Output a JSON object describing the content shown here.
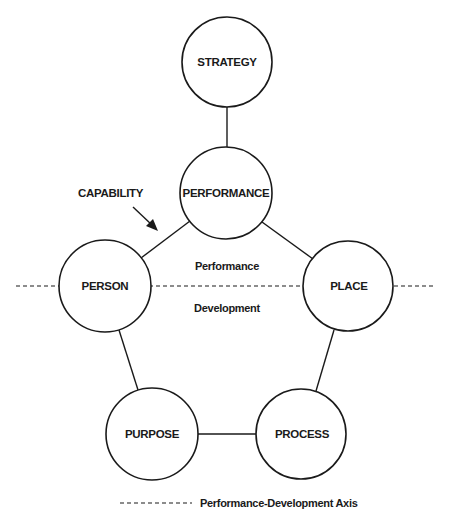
{
  "nodes": {
    "strategy": {
      "label": "STRATEGY"
    },
    "performance": {
      "label": "PERFORMANCE"
    },
    "person": {
      "label": "PERSON"
    },
    "place": {
      "label": "PLACE"
    },
    "purpose": {
      "label": "PURPOSE"
    },
    "process": {
      "label": "PROCESS"
    }
  },
  "annotations": {
    "capability": "CAPABILITY",
    "region_above": "Performance",
    "region_below": "Development"
  },
  "legend": {
    "axis_label": "Performance-Development Axis"
  },
  "edges": [
    [
      "STRATEGY",
      "PERFORMANCE"
    ],
    [
      "PERFORMANCE",
      "PERSON"
    ],
    [
      "PERFORMANCE",
      "PLACE"
    ],
    [
      "PERSON",
      "PURPOSE"
    ],
    [
      "PLACE",
      "PROCESS"
    ],
    [
      "PURPOSE",
      "PROCESS"
    ]
  ],
  "colors": {
    "stroke": "#1a1a1a",
    "background": "#ffffff"
  }
}
